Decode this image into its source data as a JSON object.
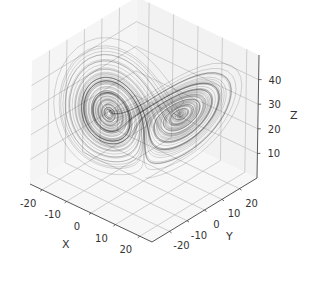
{
  "chart_data": {
    "type": "line3d",
    "title": "",
    "xlabel": "X",
    "ylabel": "Y",
    "zlabel": "Z",
    "xlim": [
      -25,
      25
    ],
    "ylim": [
      -30,
      30
    ],
    "zlim": [
      0,
      50
    ],
    "x_ticks": [
      -20,
      -10,
      0,
      10,
      20
    ],
    "y_ticks": [
      -20,
      -10,
      0,
      10,
      20
    ],
    "z_ticks": [
      10,
      20,
      30,
      40
    ],
    "x_tick_labels": [
      "-20",
      "-10",
      "0",
      "10",
      "20"
    ],
    "y_tick_labels": [
      "-20",
      "-10",
      "0",
      "10",
      "20"
    ],
    "z_tick_labels": [
      "10",
      "20",
      "30",
      "40"
    ],
    "grid": true,
    "legend": null,
    "line_color": "#000000",
    "line_alpha": 0.35,
    "pane_color": "#f2f2f2",
    "grid_color": "#b0b0b0",
    "series": [
      {
        "name": "Lorenz trajectory",
        "params": {
          "sigma": 10,
          "rho": 28,
          "beta": 2.6667
        },
        "initial": [
          0.0,
          1.0,
          1.05
        ],
        "dt": 0.01,
        "steps": 10000
      }
    ]
  }
}
